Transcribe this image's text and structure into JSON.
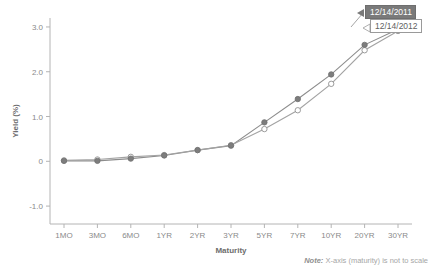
{
  "chart_data": {
    "type": "line",
    "title": "",
    "xlabel": "Maturity",
    "ylabel": "Yield (%)",
    "categories": [
      "1MO",
      "3MO",
      "6MO",
      "1YR",
      "2YR",
      "3YR",
      "5YR",
      "7YR",
      "10YR",
      "20YR",
      "30YR"
    ],
    "ylim": [
      -1.4,
      3.2
    ],
    "yticks": [
      3.0,
      2.0,
      1.0,
      0,
      -1.0
    ],
    "ytick_labels": [
      "3.0",
      "2.0",
      "1.0",
      "0",
      "-1.0"
    ],
    "grid": false,
    "legend_position": "inline-callout-right",
    "series": [
      {
        "name": "12/14/2011",
        "marker": "filled-circle",
        "color": "#7d7d7d",
        "values": [
          0.01,
          0.01,
          0.06,
          0.13,
          0.25,
          0.35,
          0.87,
          1.39,
          1.94,
          2.6,
          2.95
        ]
      },
      {
        "name": "12/14/2012",
        "marker": "open-circle",
        "color": "#9b9b9b",
        "values": [
          0.02,
          0.04,
          0.1,
          0.14,
          0.25,
          0.36,
          0.72,
          1.14,
          1.73,
          2.48,
          2.91
        ]
      }
    ],
    "annotations": [
      {
        "id": "callout-2011",
        "text": "12/14/2011",
        "style": "filled-dark"
      },
      {
        "id": "callout-2012",
        "text": "12/14/2012",
        "style": "outlined-light"
      }
    ]
  },
  "note": {
    "prefix": "Note:",
    "text": " X-axis (maturity) is not to scale"
  },
  "colors": {
    "series_2011": "#7d7d7d",
    "series_2012": "#9b9b9b",
    "axis": "#b4b4b4",
    "text": "#8a8a8a",
    "callout_fill": "#7a7a7a"
  }
}
